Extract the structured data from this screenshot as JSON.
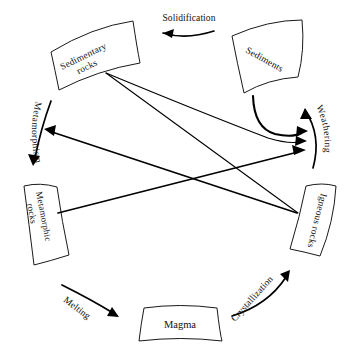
{
  "diagram": {
    "background_color": "#ffffff",
    "line_color": "#000000",
    "text_color": "#111111",
    "nodes": [
      {
        "id": "sedimentary-rocks",
        "label_line1": "Sedimentary",
        "label_line2": "rocks",
        "full_label": "Sedimentary rocks",
        "rotation_deg": -25
      },
      {
        "id": "sediments",
        "label_line1": "Sediments",
        "label_line2": "",
        "full_label": "Sediments",
        "rotation_deg": 28
      },
      {
        "id": "igneous-rocks",
        "label_line1": "Igneous rocks",
        "label_line2": "",
        "full_label": "Igneous rocks",
        "rotation_deg": 105
      },
      {
        "id": "metamorphic-rocks",
        "label_line1": "Metamorphic",
        "label_line2": "rocks",
        "full_label": "Metamorphic rocks",
        "rotation_deg": 78
      },
      {
        "id": "magma",
        "label_line1": "Magma",
        "label_line2": "",
        "full_label": "Magma",
        "rotation_deg": 0
      }
    ],
    "processes": [
      {
        "id": "solidification",
        "label": "Solidification",
        "direction": "right-to-left",
        "rotation_deg": 0
      },
      {
        "id": "weathering",
        "label": "Weathering",
        "direction": "top-down-curved",
        "rotation_deg": 90
      },
      {
        "id": "metamorphism",
        "label": "Metamorphism",
        "direction": "top-down-curved",
        "rotation_deg": 90
      },
      {
        "id": "melting",
        "label": "Melting",
        "direction": "left-to-right",
        "rotation_deg": 38
      },
      {
        "id": "crystallization",
        "label": "Crystallization",
        "direction": "left-to-right-up",
        "rotation_deg": -48
      }
    ],
    "connections": [
      {
        "from": "sediments",
        "to": "weathering",
        "style": "curved-thick"
      },
      {
        "from": "sedimentary-rocks",
        "to": "weathering",
        "style": "curved-thin"
      },
      {
        "from": "metamorphic-rocks",
        "to": "weathering",
        "style": "straight-thick"
      },
      {
        "from": "igneous-rocks",
        "to": "metamorphism",
        "style": "straight-thick"
      },
      {
        "from": "sedimentary-rocks",
        "to": "igneous-rocks",
        "style": "straight-thin"
      },
      {
        "from": "metamorphic-rocks",
        "to": "magma",
        "style": "melting-arc"
      },
      {
        "from": "magma",
        "to": "igneous-rocks",
        "style": "crystallization-arc"
      },
      {
        "from": "sediments",
        "to": "sedimentary-rocks",
        "style": "solidification-arc"
      }
    ]
  }
}
